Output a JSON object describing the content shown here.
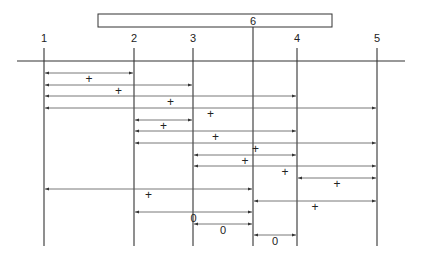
{
  "diagram": {
    "type": "interval-relation-diagram",
    "top_box": {
      "label": "6",
      "x1": 98,
      "x2": 332
    },
    "nodes": [
      {
        "id": "1",
        "label": "1",
        "x": 44
      },
      {
        "id": "2",
        "label": "2",
        "x": 134
      },
      {
        "id": "3",
        "label": "3",
        "x": 193
      },
      {
        "id": "6",
        "label": "6",
        "x": 253
      },
      {
        "id": "4",
        "label": "4",
        "x": 297
      },
      {
        "id": "5",
        "label": "5",
        "x": 377
      }
    ],
    "intervals": [
      {
        "from": "1",
        "to": "2",
        "sign": "+"
      },
      {
        "from": "1",
        "to": "3",
        "sign": "+"
      },
      {
        "from": "1",
        "to": "4",
        "sign": "+"
      },
      {
        "from": "1",
        "to": "5",
        "sign": "+"
      },
      {
        "from": "2",
        "to": "3",
        "sign": "+"
      },
      {
        "from": "2",
        "to": "4",
        "sign": "+"
      },
      {
        "from": "2",
        "to": "5",
        "sign": "+"
      },
      {
        "from": "3",
        "to": "4",
        "sign": "+"
      },
      {
        "from": "3",
        "to": "5",
        "sign": "+"
      },
      {
        "from": "4",
        "to": "5",
        "sign": "+"
      },
      {
        "from": "1",
        "to": "6",
        "sign": "+"
      },
      {
        "from": "6",
        "to": "5",
        "sign": "+"
      },
      {
        "from": "2",
        "to": "6",
        "sign": "0"
      },
      {
        "from": "3",
        "to": "6",
        "sign": "0"
      },
      {
        "from": "6",
        "to": "4",
        "sign": "0"
      }
    ]
  }
}
